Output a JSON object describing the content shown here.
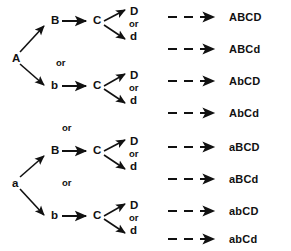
{
  "diagram": {
    "type": "branch-tree",
    "width": 291,
    "height": 251,
    "line_color": "#111111",
    "text_color": "#111111",
    "groups": [
      {
        "id": "group-A",
        "root": "A",
        "root_pos": {
          "x": 13,
          "y": 55
        },
        "separator_or": {
          "label": "or",
          "x": 57,
          "y": 55
        },
        "subgroups": [
          {
            "id": "A-B",
            "second": "B",
            "second_pos": {
              "x": 52,
              "y": 18
            },
            "third": "C",
            "third_pos": {
              "x": 94,
              "y": 18
            },
            "fourth_upper": "D",
            "fourth_or": "or",
            "fourth_lower": "d",
            "fourth_pos": {
              "x": 131,
              "y": 8
            },
            "outcomes": [
              "ABCD",
              "ABCd"
            ]
          },
          {
            "id": "A-b",
            "second": "b",
            "second_pos": {
              "x": 52,
              "y": 82
            },
            "third": "C",
            "third_pos": {
              "x": 94,
              "y": 82
            },
            "fourth_upper": "D",
            "fourth_or": "or",
            "fourth_lower": "d",
            "fourth_pos": {
              "x": 131,
              "y": 72
            },
            "outcomes": [
              "AbCD",
              "AbCd"
            ]
          }
        ]
      },
      {
        "id": "group-a",
        "root": "a",
        "root_pos": {
          "x": 13,
          "y": 180
        },
        "separator_or_top": {
          "label": "or",
          "x": 62,
          "y": 125
        },
        "separator_or_mid": {
          "label": "or",
          "x": 62,
          "y": 180
        },
        "subgroups": [
          {
            "id": "a-B",
            "second": "B",
            "second_pos": {
              "x": 52,
              "y": 148
            },
            "third": "C",
            "third_pos": {
              "x": 94,
              "y": 148
            },
            "fourth_upper": "D",
            "fourth_or": "or",
            "fourth_lower": "d",
            "fourth_pos": {
              "x": 131,
              "y": 138
            },
            "outcomes": [
              "aBCD",
              "aBCd"
            ]
          },
          {
            "id": "a-b",
            "second": "b",
            "second_pos": {
              "x": 52,
              "y": 212
            },
            "third": "C",
            "third_pos": {
              "x": 94,
              "y": 212
            },
            "fourth_upper": "D",
            "fourth_or": "or",
            "fourth_lower": "d",
            "fourth_pos": {
              "x": 131,
              "y": 202
            },
            "outcomes": [
              "abCD",
              "abCd"
            ]
          }
        ]
      }
    ],
    "or_labels": {
      "group_A_middle": "or",
      "group_a_top": "or",
      "group_a_middle": "or",
      "branch_or": "or"
    },
    "nodes": {
      "A": "A",
      "a": "a",
      "B": "B",
      "b": "b",
      "C": "C",
      "D": "D",
      "d": "d"
    },
    "outcomes": [
      {
        "id": "outcome-1",
        "label": "ABCD",
        "x": 229,
        "y": 12
      },
      {
        "id": "outcome-2",
        "label": "ABCd",
        "x": 229,
        "y": 44
      },
      {
        "id": "outcome-3",
        "label": "AbCD",
        "x": 229,
        "y": 76
      },
      {
        "id": "outcome-4",
        "label": "AbCd",
        "x": 229,
        "y": 108
      },
      {
        "id": "outcome-5",
        "label": "aBCD",
        "x": 229,
        "y": 142
      },
      {
        "id": "outcome-6",
        "label": "aBCd",
        "x": 229,
        "y": 174
      },
      {
        "id": "outcome-7",
        "label": "abCD",
        "x": 229,
        "y": 206
      },
      {
        "id": "outcome-8",
        "label": "abCd",
        "x": 229,
        "y": 234
      }
    ],
    "dashed_arrows": [
      {
        "id": "dashed-1",
        "y": 17
      },
      {
        "id": "dashed-2",
        "y": 49
      },
      {
        "id": "dashed-3",
        "y": 81
      },
      {
        "id": "dashed-4",
        "y": 113
      },
      {
        "id": "dashed-5",
        "y": 147
      },
      {
        "id": "dashed-6",
        "y": 179
      },
      {
        "id": "dashed-7",
        "y": 211
      },
      {
        "id": "dashed-8",
        "y": 239
      }
    ]
  }
}
